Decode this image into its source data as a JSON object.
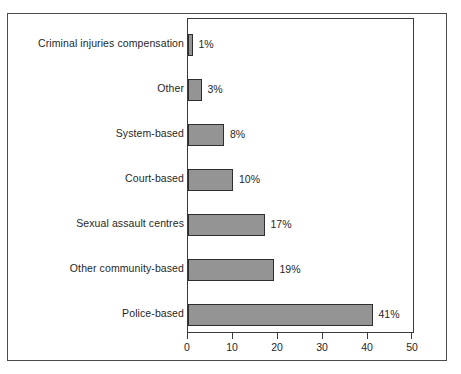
{
  "chart_data": {
    "type": "bar",
    "orientation": "horizontal",
    "title": "",
    "subtitle": "",
    "xlabel": "",
    "ylabel": "",
    "xlim": [
      0,
      50
    ],
    "xticks": [
      0,
      10,
      20,
      30,
      40,
      50
    ],
    "xtick_labels": [
      "0",
      "10",
      "20",
      "30",
      "40",
      "50"
    ],
    "grid": false,
    "legend": null,
    "bar_color": "#949494",
    "bar_edge_color": "#2e2e2e",
    "categories": [
      "Criminal injuries compensation",
      "Other",
      "System-based",
      "Court-based",
      "Sexual assault centres",
      "Other community-based",
      "Police-based"
    ],
    "values": [
      1,
      3,
      8,
      10,
      17,
      19,
      41
    ],
    "data_labels": [
      "1%",
      "3%",
      "8%",
      "10%",
      "17%",
      "19%",
      "41%"
    ],
    "bars": [
      {
        "category": "Criminal injuries compensation",
        "value": 1,
        "label": "1%"
      },
      {
        "category": "Other",
        "value": 3,
        "label": "3%"
      },
      {
        "category": "System-based",
        "value": 8,
        "label": "8%"
      },
      {
        "category": "Court-based",
        "value": 10,
        "label": "10%"
      },
      {
        "category": "Sexual assault centres",
        "value": 17,
        "label": "17%"
      },
      {
        "category": "Other community-based",
        "value": 19,
        "label": "19%"
      },
      {
        "category": "Police-based",
        "value": 41,
        "label": "41%"
      }
    ]
  }
}
